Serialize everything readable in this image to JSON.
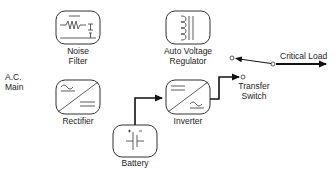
{
  "diagram": {
    "source_label": {
      "line1": "A.C.",
      "line2": "Main"
    },
    "blocks": [
      {
        "id": "noise_filter",
        "line1": "Noise",
        "line2": "Filter",
        "icon": "noise-filter-icon"
      },
      {
        "id": "avr",
        "line1": "Auto Voltage",
        "line2": "Regulator",
        "icon": "transformer-coil-icon"
      },
      {
        "id": "rectifier",
        "line1": "Rectifier",
        "icon": "ac-to-dc-icon"
      },
      {
        "id": "inverter",
        "line1": "Inverter",
        "icon": "dc-to-ac-icon"
      },
      {
        "id": "battery",
        "line1": "Battery",
        "icon": "battery-cell-icon"
      }
    ],
    "switch": {
      "line1": "Transfer",
      "line2": "Switch"
    },
    "output": {
      "label": "Critical Load"
    },
    "colors": {
      "stroke": "#222222",
      "background": "#ffffff"
    }
  }
}
